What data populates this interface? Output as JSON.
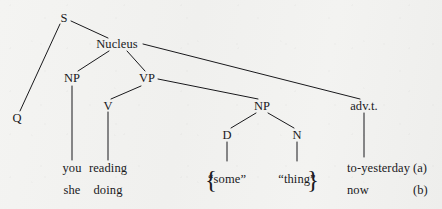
{
  "figure": {
    "kind": "syntax-tree-diagram",
    "background_color": "#f1f1ef",
    "ink_color": "#19191c"
  },
  "nodes": [
    {
      "id": "s",
      "label": "S",
      "x": 64,
      "y": 18,
      "kind": "nonterminal"
    },
    {
      "id": "nucleus",
      "label": "Nucleus",
      "x": 117,
      "y": 44,
      "kind": "nonterminal"
    },
    {
      "id": "np1",
      "label": "NP",
      "x": 72,
      "y": 78,
      "kind": "nonterminal"
    },
    {
      "id": "vp",
      "label": "VP",
      "x": 147,
      "y": 78,
      "kind": "nonterminal"
    },
    {
      "id": "v",
      "label": "V",
      "x": 108,
      "y": 106,
      "kind": "nonterminal"
    },
    {
      "id": "np2",
      "label": "NP",
      "x": 262,
      "y": 106,
      "kind": "nonterminal"
    },
    {
      "id": "advt",
      "label": "adv.t.",
      "x": 364,
      "y": 106,
      "kind": "nonterminal"
    },
    {
      "id": "d",
      "label": "D",
      "x": 227,
      "y": 135,
      "kind": "nonterminal"
    },
    {
      "id": "n",
      "label": "N",
      "x": 297,
      "y": 135,
      "kind": "nonterminal"
    },
    {
      "id": "q",
      "label": "Q",
      "x": 17,
      "y": 118,
      "kind": "nonterminal"
    }
  ],
  "edges": [
    {
      "from": "s",
      "to": "q",
      "x1": 60,
      "y1": 24,
      "x2": 20,
      "y2": 111
    },
    {
      "from": "s",
      "to": "nucleus",
      "x1": 71,
      "y1": 21,
      "x2": 108,
      "y2": 38
    },
    {
      "from": "nucleus",
      "to": "np1",
      "x1": 109,
      "y1": 51,
      "x2": 78,
      "y2": 71
    },
    {
      "from": "nucleus",
      "to": "vp",
      "x1": 127,
      "y1": 51,
      "x2": 145,
      "y2": 71
    },
    {
      "from": "nucleus",
      "to": "advt",
      "x1": 143,
      "y1": 44,
      "x2": 360,
      "y2": 99
    },
    {
      "from": "np1",
      "to": "you",
      "x1": 72,
      "y1": 86,
      "x2": 72,
      "y2": 160
    },
    {
      "from": "vp",
      "to": "v",
      "x1": 141,
      "y1": 86,
      "x2": 111,
      "y2": 99
    },
    {
      "from": "vp",
      "to": "np2",
      "x1": 158,
      "y1": 79,
      "x2": 258,
      "y2": 99
    },
    {
      "from": "v",
      "to": "reading",
      "x1": 108,
      "y1": 112,
      "x2": 108,
      "y2": 160
    },
    {
      "from": "np2",
      "to": "d",
      "x1": 256,
      "y1": 113,
      "x2": 231,
      "y2": 128
    },
    {
      "from": "np2",
      "to": "n",
      "x1": 268,
      "y1": 113,
      "x2": 294,
      "y2": 128
    },
    {
      "from": "d",
      "to": "some",
      "x1": 227,
      "y1": 142,
      "x2": 227,
      "y2": 161
    },
    {
      "from": "n",
      "to": "thing",
      "x1": 297,
      "y1": 142,
      "x2": 297,
      "y2": 161
    },
    {
      "from": "advt",
      "to": "toyest",
      "x1": 364,
      "y1": 113,
      "x2": 364,
      "y2": 157
    }
  ],
  "terminals": {
    "row_a": [
      {
        "id": "you",
        "text": "you",
        "x": 72,
        "y": 168,
        "align": "center"
      },
      {
        "id": "reading",
        "text": "reading",
        "x": 108,
        "y": 168,
        "align": "center"
      },
      {
        "id": "toyest",
        "text": "to-yesterday",
        "x": 347,
        "y": 168,
        "align": "left"
      }
    ],
    "row_b": [
      {
        "id": "she",
        "text": "she",
        "x": 72,
        "y": 190,
        "align": "center"
      },
      {
        "id": "doing",
        "text": "doing",
        "x": 108,
        "y": 190,
        "align": "center"
      },
      {
        "id": "now",
        "text": "now",
        "x": 347,
        "y": 190,
        "align": "left"
      }
    ],
    "braced_group": {
      "open_brace": "{",
      "close_brace": "}",
      "open_x": 211,
      "close_x": 313,
      "y": 179,
      "items": [
        {
          "id": "some",
          "text": "“some”",
          "x": 227,
          "y": 179
        },
        {
          "id": "thing",
          "text": "“thing”",
          "x": 297,
          "y": 179
        }
      ]
    }
  },
  "alternation_labels": [
    {
      "id": "label-a",
      "text": "(a)",
      "x": 413,
      "y": 168
    },
    {
      "id": "label-b",
      "text": "(b)",
      "x": 413,
      "y": 190
    }
  ]
}
